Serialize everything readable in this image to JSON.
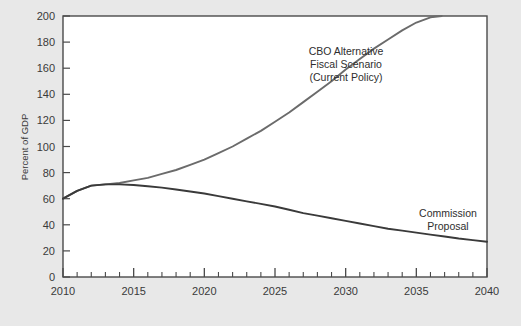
{
  "chart_data": {
    "type": "line",
    "title": "",
    "subtitle": "",
    "xlabel": "",
    "ylabel": "Percent of GDP",
    "xlim": [
      2010,
      2040
    ],
    "ylim": [
      0,
      200
    ],
    "grid": false,
    "legend_position": "inline-annotation",
    "x_ticks": [
      2010,
      2015,
      2020,
      2025,
      2030,
      2035,
      2040
    ],
    "x_tick_labels": [
      "2010",
      "2015",
      "2020",
      "2025",
      "2030",
      "2035",
      "2040"
    ],
    "x_minor_tick_step": 1,
    "y_ticks": [
      0,
      20,
      40,
      60,
      80,
      100,
      120,
      140,
      160,
      180,
      200
    ],
    "y_tick_labels": [
      "0",
      "20",
      "40",
      "60",
      "80",
      "100",
      "120",
      "140",
      "160",
      "180",
      "200"
    ],
    "series": [
      {
        "name": "CBO Alternative Fiscal Scenario (Current Policy)",
        "color": "#6b6b6b",
        "x": [
          2010,
          2011,
          2012,
          2013,
          2014,
          2015,
          2016,
          2017,
          2018,
          2019,
          2020,
          2021,
          2022,
          2023,
          2024,
          2025,
          2026,
          2027,
          2028,
          2029,
          2030,
          2031,
          2032,
          2033,
          2034,
          2035,
          2036,
          2036.8
        ],
        "values": [
          60,
          66,
          70,
          71,
          72,
          74,
          76,
          79,
          82,
          86,
          90,
          95,
          100,
          106,
          112,
          119,
          126,
          134,
          142,
          150,
          159,
          167,
          175,
          182,
          189,
          195,
          199,
          200
        ]
      },
      {
        "name": "Commission Proposal",
        "color": "#3a3a3a",
        "x": [
          2010,
          2011,
          2012,
          2013,
          2014,
          2015,
          2016,
          2017,
          2018,
          2019,
          2020,
          2021,
          2022,
          2023,
          2024,
          2025,
          2026,
          2027,
          2028,
          2029,
          2030,
          2031,
          2032,
          2033,
          2034,
          2035,
          2036,
          2037,
          2038,
          2039,
          2040
        ],
        "values": [
          60,
          66,
          70,
          71,
          71,
          70.5,
          69.5,
          68.5,
          67,
          65.5,
          64,
          62,
          60,
          58,
          56,
          54,
          51.5,
          49,
          47,
          45,
          43,
          41,
          39,
          37,
          35.5,
          34,
          32.5,
          31,
          29.5,
          28.3,
          27
        ]
      }
    ],
    "annotations": [
      {
        "name": "cbo-annotation",
        "lines": [
          "CBO Alternative",
          "Fiscal Scenario",
          "(Current Policy)"
        ],
        "x_px": 346,
        "y_px": 55
      },
      {
        "name": "commission-annotation",
        "lines": [
          "Commission",
          "Proposal"
        ],
        "x_px": 448,
        "y_px": 217
      }
    ],
    "colors": {
      "background": "#e8e8e8",
      "plot_background": "#ffffff",
      "frame": "#4a4a4a",
      "text": "#3a3a3a"
    }
  }
}
